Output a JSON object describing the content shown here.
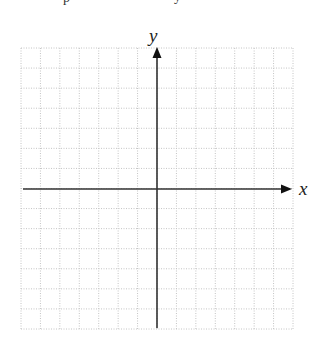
{
  "diagram": {
    "type": "coordinate-plane",
    "grid": {
      "left": 21,
      "top": 48,
      "right": 293,
      "bottom": 329,
      "columns": 14,
      "rows": 14,
      "line_color": "#c4c4c4",
      "line_style": "dotted"
    },
    "origin": {
      "x": 157,
      "y": 189
    },
    "axes": {
      "color": "#333333",
      "x_axis": {
        "label": "x",
        "from": 23,
        "to": 292
      },
      "y_axis": {
        "label": "y",
        "from": 328,
        "to": 47
      }
    }
  },
  "chart_data": {
    "type": "grid",
    "title": "",
    "xlabel": "x",
    "ylabel": "y",
    "grid": true,
    "x_cells_each_side": 7,
    "y_cells_each_side": 7,
    "series": []
  }
}
